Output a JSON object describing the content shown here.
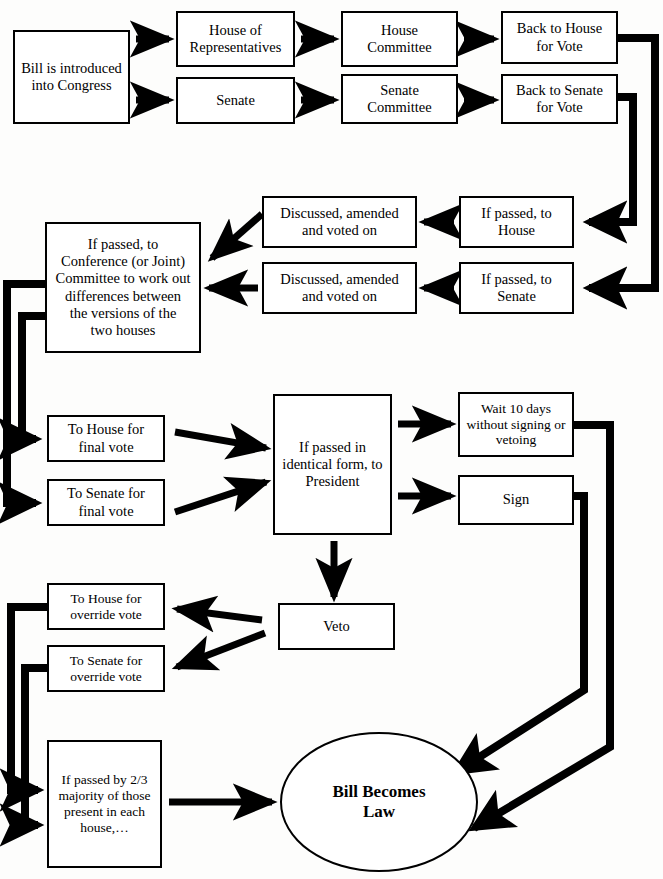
{
  "diagram": {
    "type": "flowchart",
    "nodes": {
      "bill_introduced": {
        "label": "Bill is introduced\ninto Congress",
        "shape": "rect",
        "x": 13,
        "y": 30,
        "w": 117,
        "h": 94
      },
      "house_of_representatives": {
        "label": "House of\nRepresentatives",
        "shape": "rect",
        "x": 176,
        "y": 11,
        "w": 119,
        "h": 56
      },
      "senate": {
        "label": "Senate",
        "shape": "rect",
        "x": 176,
        "y": 77,
        "w": 119,
        "h": 47
      },
      "house_committee": {
        "label": "House\nCommittee",
        "shape": "rect",
        "x": 341,
        "y": 11,
        "w": 117,
        "h": 56
      },
      "senate_committee": {
        "label": "Senate\nCommittee",
        "shape": "rect",
        "x": 341,
        "y": 74,
        "w": 117,
        "h": 50
      },
      "back_to_house_vote": {
        "label": "Back to House\nfor Vote",
        "shape": "rect",
        "x": 501,
        "y": 11,
        "w": 117,
        "h": 53
      },
      "back_to_senate_vote": {
        "label": "Back to Senate\nfor Vote",
        "shape": "rect",
        "x": 501,
        "y": 74,
        "w": 117,
        "h": 50
      },
      "if_passed_to_house": {
        "label": "If passed, to\nHouse",
        "shape": "rect",
        "x": 459,
        "y": 196,
        "w": 115,
        "h": 52
      },
      "if_passed_to_senate": {
        "label": "If passed, to\nSenate",
        "shape": "rect",
        "x": 459,
        "y": 262,
        "w": 115,
        "h": 52
      },
      "discussed_house": {
        "label": "Discussed, amended\nand voted on",
        "shape": "rect",
        "x": 262,
        "y": 196,
        "w": 155,
        "h": 52
      },
      "discussed_senate": {
        "label": "Discussed, amended\nand voted on",
        "shape": "rect",
        "x": 262,
        "y": 262,
        "w": 155,
        "h": 52
      },
      "conference_committee": {
        "label": "If passed, to\nConference (or Joint)\nCommittee to work out\ndifferences between\nthe versions of the\ntwo houses",
        "shape": "rect",
        "x": 45,
        "y": 222,
        "w": 156,
        "h": 131
      },
      "to_house_final_vote": {
        "label": "To House for\nfinal vote",
        "shape": "rect",
        "x": 47,
        "y": 415,
        "w": 118,
        "h": 47
      },
      "to_senate_final_vote": {
        "label": "To Senate for\nfinal vote",
        "shape": "rect",
        "x": 47,
        "y": 479,
        "w": 118,
        "h": 47
      },
      "to_president": {
        "label": "If passed in\nidentical form, to\nPresident",
        "shape": "rect",
        "x": 273,
        "y": 394,
        "w": 119,
        "h": 141
      },
      "wait_ten_days": {
        "label": "Wait 10 days\nwithout signing or\nvetoing",
        "shape": "rect",
        "x": 458,
        "y": 392,
        "w": 116,
        "h": 65
      },
      "sign": {
        "label": "Sign",
        "shape": "rect",
        "x": 458,
        "y": 475,
        "w": 116,
        "h": 50
      },
      "veto": {
        "label": "Veto",
        "shape": "rect",
        "x": 278,
        "y": 603,
        "w": 117,
        "h": 47
      },
      "to_house_override": {
        "label": "To House for\noverride vote",
        "shape": "rect",
        "x": 47,
        "y": 583,
        "w": 118,
        "h": 47
      },
      "to_senate_override": {
        "label": "To Senate for\noverride vote",
        "shape": "rect",
        "x": 47,
        "y": 645,
        "w": 118,
        "h": 47
      },
      "two_thirds_majority": {
        "label": "If passed by 2/3\nmajority of those\npresent in each\nhouse,…",
        "shape": "rect",
        "x": 47,
        "y": 740,
        "w": 115,
        "h": 128
      },
      "bill_becomes_law": {
        "label": "Bill Becomes\nLaw",
        "shape": "ellipse",
        "x": 280,
        "y": 732,
        "w": 198,
        "h": 140
      }
    },
    "edges": [
      {
        "from": "bill_introduced",
        "to": "house_of_representatives",
        "style": "arrow"
      },
      {
        "from": "bill_introduced",
        "to": "senate",
        "style": "arrow"
      },
      {
        "from": "house_of_representatives",
        "to": "house_committee",
        "style": "arrow"
      },
      {
        "from": "senate",
        "to": "senate_committee",
        "style": "arrow"
      },
      {
        "from": "house_committee",
        "to": "back_to_house_vote",
        "style": "arrow"
      },
      {
        "from": "senate_committee",
        "to": "back_to_senate_vote",
        "style": "arrow"
      },
      {
        "from": "back_to_house_vote",
        "to": "if_passed_to_senate",
        "style": "routed-arrow"
      },
      {
        "from": "back_to_senate_vote",
        "to": "if_passed_to_house",
        "style": "routed-arrow"
      },
      {
        "from": "if_passed_to_house",
        "to": "discussed_house",
        "style": "arrow"
      },
      {
        "from": "if_passed_to_senate",
        "to": "discussed_senate",
        "style": "arrow"
      },
      {
        "from": "discussed_house",
        "to": "conference_committee",
        "style": "diagonal-arrow"
      },
      {
        "from": "discussed_senate",
        "to": "conference_committee",
        "style": "arrow"
      },
      {
        "from": "conference_committee",
        "to": "to_house_final_vote",
        "style": "routed-arrow"
      },
      {
        "from": "conference_committee",
        "to": "to_senate_final_vote",
        "style": "routed-arrow"
      },
      {
        "from": "to_house_final_vote",
        "to": "to_president",
        "style": "diagonal-arrow"
      },
      {
        "from": "to_senate_final_vote",
        "to": "to_president",
        "style": "diagonal-arrow"
      },
      {
        "from": "to_president",
        "to": "wait_ten_days",
        "style": "arrow"
      },
      {
        "from": "to_president",
        "to": "sign",
        "style": "arrow"
      },
      {
        "from": "to_president",
        "to": "veto",
        "style": "arrow"
      },
      {
        "from": "wait_ten_days",
        "to": "bill_becomes_law",
        "style": "routed-arrow"
      },
      {
        "from": "sign",
        "to": "bill_becomes_law",
        "style": "routed-arrow"
      },
      {
        "from": "veto",
        "to": "to_house_override",
        "style": "diagonal-arrow"
      },
      {
        "from": "veto",
        "to": "to_senate_override",
        "style": "diagonal-arrow"
      },
      {
        "from": "to_house_override",
        "to": "two_thirds_majority",
        "style": "routed-arrow"
      },
      {
        "from": "to_senate_override",
        "to": "two_thirds_majority",
        "style": "routed-arrow"
      },
      {
        "from": "two_thirds_majority",
        "to": "bill_becomes_law",
        "style": "arrow"
      }
    ]
  }
}
